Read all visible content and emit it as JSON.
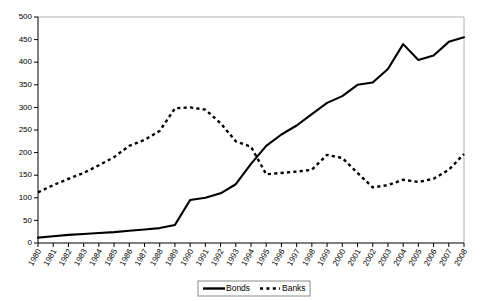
{
  "chart_data": {
    "type": "line",
    "title": "",
    "xlabel": "",
    "ylabel": "",
    "grid": false,
    "legend_position": "bottom-center",
    "xlim": [
      1980,
      2008
    ],
    "ylim": [
      0,
      500
    ],
    "ytick_step": 50,
    "categories": [
      1980,
      1981,
      1982,
      1983,
      1984,
      1985,
      1986,
      1987,
      1988,
      1989,
      1990,
      1991,
      1992,
      1993,
      1994,
      1995,
      1996,
      1997,
      1998,
      1999,
      2000,
      2001,
      2002,
      2003,
      2004,
      2005,
      2006,
      2007,
      2008
    ],
    "xtick_labels": [
      "1980",
      "1981",
      "1982",
      "1983",
      "1984",
      "1985",
      "1986",
      "1987",
      "1988",
      "1989",
      "1990",
      "1991",
      "1992",
      "1993",
      "1994",
      "1995",
      "1996",
      "1997",
      "1998",
      "1999",
      "2000",
      "2001",
      "2002",
      "2003",
      "2004",
      "2005",
      "2006",
      "2007",
      "2008"
    ],
    "ytick_labels": [
      "0",
      "50",
      "100",
      "150",
      "200",
      "250",
      "300",
      "350",
      "400",
      "450",
      "500"
    ],
    "series": [
      {
        "name": "Bonds",
        "style": "solid",
        "values": [
          12,
          15,
          18,
          20,
          22,
          24,
          27,
          30,
          33,
          40,
          95,
          100,
          110,
          130,
          175,
          215,
          240,
          260,
          285,
          310,
          325,
          350,
          355,
          385,
          440,
          405,
          415,
          445,
          455
        ]
      },
      {
        "name": "Banks",
        "style": "dashed",
        "values": [
          112,
          128,
          142,
          155,
          172,
          190,
          215,
          228,
          248,
          298,
          300,
          295,
          265,
          225,
          213,
          152,
          155,
          158,
          162,
          195,
          188,
          155,
          123,
          128,
          140,
          135,
          142,
          162,
          197
        ]
      }
    ]
  },
  "legend": {
    "items": [
      {
        "label": "Bonds",
        "style": "solid"
      },
      {
        "label": "Banks",
        "style": "dashed"
      }
    ]
  }
}
